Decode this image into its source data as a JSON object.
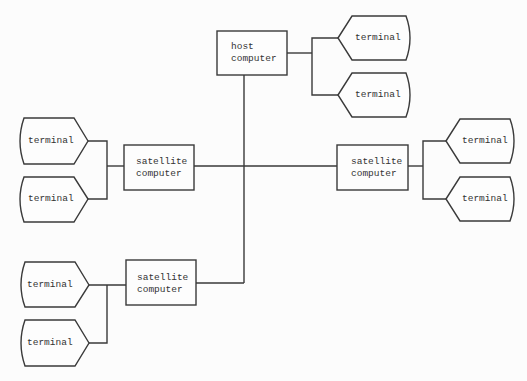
{
  "diagram": {
    "host": {
      "label_line1": "host",
      "label_line2": "computer"
    },
    "satellite_left": {
      "label_line1": "satellite",
      "label_line2": "computer"
    },
    "satellite_right": {
      "label_line1": "satellite",
      "label_line2": "computer"
    },
    "satellite_bottom": {
      "label_line1": "satellite",
      "label_line2": "computer"
    },
    "terminals": [
      {
        "label": "terminal"
      },
      {
        "label": "terminal"
      },
      {
        "label": "terminal"
      },
      {
        "label": "terminal"
      },
      {
        "label": "terminal"
      },
      {
        "label": "terminal"
      },
      {
        "label": "terminal"
      },
      {
        "label": "terminal"
      }
    ]
  }
}
